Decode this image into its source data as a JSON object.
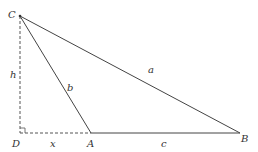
{
  "diagram": {
    "points": {
      "C": {
        "label": "C",
        "x": 20,
        "y": 16
      },
      "D": {
        "label": "D",
        "x": 20,
        "y": 133
      },
      "A": {
        "label": "A",
        "x": 91,
        "y": 133
      },
      "B": {
        "label": "B",
        "x": 240,
        "y": 133
      }
    },
    "segments": {
      "a": {
        "label": "a",
        "from": "C",
        "to": "B",
        "style": "solid"
      },
      "b": {
        "label": "b",
        "from": "C",
        "to": "A",
        "style": "solid"
      },
      "c": {
        "label": "c",
        "from": "A",
        "to": "B",
        "style": "solid"
      },
      "h": {
        "label": "h",
        "from": "C",
        "to": "D",
        "style": "dashed"
      },
      "x": {
        "label": "x",
        "from": "D",
        "to": "A",
        "style": "dashed"
      }
    },
    "right_angle_at": "D",
    "colors": {
      "line": "#444444",
      "text": "#333333"
    }
  }
}
